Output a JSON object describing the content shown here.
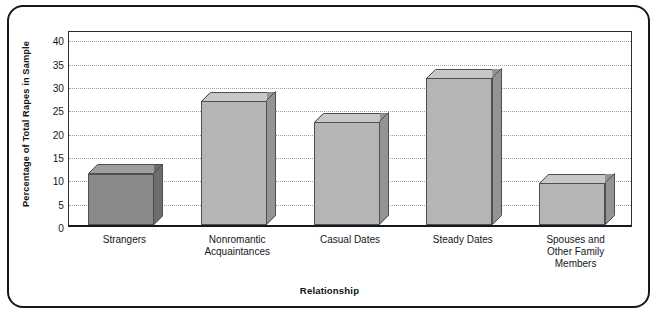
{
  "chart_data": {
    "type": "bar",
    "title": "",
    "subtitle": "",
    "xlabel": "Relationship",
    "ylabel": "Percentage of Total Rapes in Sample",
    "categories": [
      "Strangers",
      "Nonromantic\nAcquaintances",
      "Casual Dates",
      "Steady Dates",
      "Spouses and\nOther Family\nMembers"
    ],
    "values": [
      11,
      26.5,
      22,
      31.5,
      9
    ],
    "ylim": [
      0,
      42
    ],
    "yticks": [
      0,
      5,
      10,
      15,
      20,
      25,
      30,
      35,
      40
    ],
    "ytick_labels": [
      "0",
      "5",
      "10",
      "15",
      "20",
      "25",
      "30",
      "35",
      "40"
    ],
    "grid": "horizontal-dotted",
    "legend": "none",
    "bar_style": "3d-extruded",
    "bar_colors": [
      "#8a8a8a",
      "#b5b5b5",
      "#b5b5b5",
      "#b5b5b5",
      "#b5b5b5"
    ],
    "bar_top_colors": [
      "#9d9d9d",
      "#c8c8c8",
      "#c8c8c8",
      "#c8c8c8",
      "#c8c8c8"
    ],
    "bar_side_colors": [
      "#6d6d6d",
      "#949494",
      "#949494",
      "#949494",
      "#949494"
    ],
    "outline_color": "#4c5055",
    "gridline_color": "#9aa0a6",
    "axis_color": "#16191d",
    "frame_color": "#15181c",
    "background": "#ffffff"
  }
}
